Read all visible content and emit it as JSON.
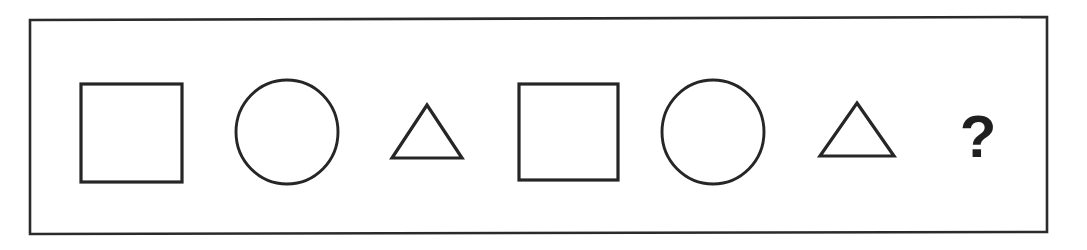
{
  "puzzle": {
    "type": "shape-sequence-pattern",
    "frame": {
      "label": "puzzle-frame",
      "stroke_color": "#2b2b2b",
      "background_color": "#ffffff"
    },
    "sequence_label": "square, circle, triangle, square, circle, triangle, ?",
    "stroke_color": "#262626",
    "items": [
      {
        "index": 1,
        "shape": "square",
        "name": "square",
        "is_answer_slot": false,
        "cx": 131,
        "cy": 133,
        "size": 99
      },
      {
        "index": 2,
        "shape": "circle",
        "name": "circle",
        "is_answer_slot": false,
        "cx": 287,
        "cy": 132,
        "size": 103
      },
      {
        "index": 3,
        "shape": "triangle",
        "name": "triangle",
        "is_answer_slot": false,
        "cx": 427,
        "cy": 132,
        "size": 71
      },
      {
        "index": 4,
        "shape": "square",
        "name": "square",
        "is_answer_slot": false,
        "cx": 568,
        "cy": 132,
        "size": 98
      },
      {
        "index": 5,
        "shape": "circle",
        "name": "circle",
        "is_answer_slot": false,
        "cx": 713,
        "cy": 132,
        "size": 103
      },
      {
        "index": 6,
        "shape": "triangle",
        "name": "triangle",
        "is_answer_slot": false,
        "cx": 857,
        "cy": 130,
        "size": 74
      },
      {
        "index": 7,
        "shape": "question-mark",
        "name": "question-mark",
        "is_answer_slot": true,
        "label": "?",
        "cx": 978,
        "cy": 133,
        "size": 46
      }
    ]
  }
}
